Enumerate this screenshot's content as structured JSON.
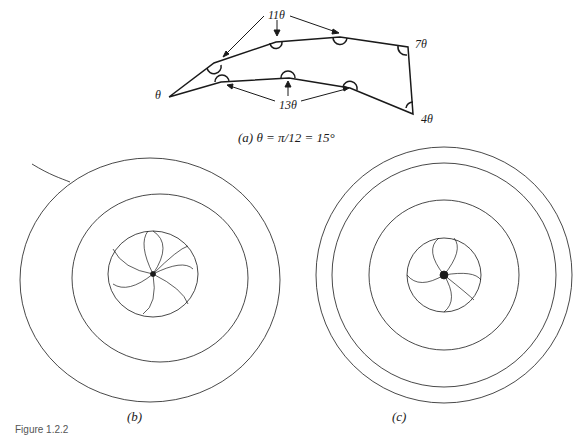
{
  "figure": {
    "number_label": "Figure 1.2.2",
    "panel_a": {
      "caption": "(a)  θ = π/12 = 15°",
      "labels": {
        "theta": "θ",
        "eleven_theta": "11θ",
        "thirteen_theta": "13θ",
        "seven_theta": "7θ",
        "four_theta": "4θ"
      }
    },
    "panel_b": {
      "caption": "(b)"
    },
    "panel_c": {
      "caption": "(c)"
    }
  },
  "colors": {
    "ink": "#1a1a1a",
    "background": "#ffffff"
  }
}
